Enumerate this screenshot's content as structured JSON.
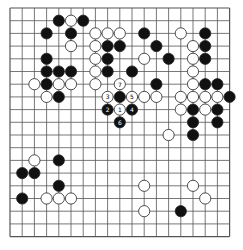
{
  "board": {
    "size": 19,
    "origin": {
      "x": 10,
      "y": 8
    },
    "spacing": {
      "x": 12.2,
      "y": 12.7
    },
    "stone_radius": 5.6,
    "colors": {
      "line": "#555555",
      "black": "#111111",
      "white": "#ffffff",
      "background": "#ffffff"
    }
  },
  "stones": [
    {
      "c": 4,
      "r": 1,
      "color": "B"
    },
    {
      "c": 5,
      "r": 1,
      "color": "W"
    },
    {
      "c": 6,
      "r": 1,
      "color": "B"
    },
    {
      "c": 3,
      "r": 2,
      "color": "B"
    },
    {
      "c": 5,
      "r": 2,
      "color": "B"
    },
    {
      "c": 7,
      "r": 2,
      "color": "W"
    },
    {
      "c": 8,
      "r": 2,
      "color": "W"
    },
    {
      "c": 9,
      "r": 2,
      "color": "W"
    },
    {
      "c": 11,
      "r": 2,
      "color": "B"
    },
    {
      "c": 14,
      "r": 2,
      "color": "W"
    },
    {
      "c": 16,
      "r": 2,
      "color": "B"
    },
    {
      "c": 5,
      "r": 3,
      "color": "W"
    },
    {
      "c": 7,
      "r": 3,
      "color": "W"
    },
    {
      "c": 8,
      "r": 3,
      "color": "B"
    },
    {
      "c": 9,
      "r": 3,
      "color": "B"
    },
    {
      "c": 12,
      "r": 3,
      "color": "B"
    },
    {
      "c": 15,
      "r": 3,
      "color": "W"
    },
    {
      "c": 16,
      "r": 3,
      "color": "B"
    },
    {
      "c": 3,
      "r": 4,
      "color": "B"
    },
    {
      "c": 7,
      "r": 4,
      "color": "W"
    },
    {
      "c": 8,
      "r": 4,
      "color": "B"
    },
    {
      "c": 11,
      "r": 4,
      "color": "W"
    },
    {
      "c": 13,
      "r": 4,
      "color": "B"
    },
    {
      "c": 15,
      "r": 4,
      "color": "W"
    },
    {
      "c": 16,
      "r": 4,
      "color": "B"
    },
    {
      "c": 3,
      "r": 5,
      "color": "B"
    },
    {
      "c": 4,
      "r": 5,
      "color": "B"
    },
    {
      "c": 5,
      "r": 5,
      "color": "B"
    },
    {
      "c": 7,
      "r": 5,
      "color": "W"
    },
    {
      "c": 8,
      "r": 5,
      "color": "B"
    },
    {
      "c": 10,
      "r": 5,
      "color": "B"
    },
    {
      "c": 15,
      "r": 5,
      "color": "W"
    },
    {
      "c": 2,
      "r": 6,
      "color": "W"
    },
    {
      "c": 3,
      "r": 6,
      "color": "B"
    },
    {
      "c": 4,
      "r": 6,
      "color": "W"
    },
    {
      "c": 5,
      "r": 6,
      "color": "W"
    },
    {
      "c": 7,
      "r": 6,
      "color": "W"
    },
    {
      "c": 9,
      "r": 6,
      "color": "W",
      "label": "7"
    },
    {
      "c": 12,
      "r": 6,
      "color": "B"
    },
    {
      "c": 15,
      "r": 6,
      "color": "W"
    },
    {
      "c": 16,
      "r": 6,
      "color": "B"
    },
    {
      "c": 17,
      "r": 6,
      "color": "B"
    },
    {
      "c": 3,
      "r": 7,
      "color": "W"
    },
    {
      "c": 4,
      "r": 7,
      "color": "B"
    },
    {
      "c": 8,
      "r": 7,
      "color": "W",
      "label": "3"
    },
    {
      "c": 9,
      "r": 7,
      "color": "B"
    },
    {
      "c": 10,
      "r": 7,
      "color": "W",
      "label": "5"
    },
    {
      "c": 11,
      "r": 7,
      "color": "W"
    },
    {
      "c": 12,
      "r": 7,
      "color": "W"
    },
    {
      "c": 14,
      "r": 7,
      "color": "W"
    },
    {
      "c": 15,
      "r": 7,
      "color": "W"
    },
    {
      "c": 16,
      "r": 7,
      "color": "W"
    },
    {
      "c": 17,
      "r": 7,
      "color": "W"
    },
    {
      "c": 18,
      "r": 7,
      "color": "B"
    },
    {
      "c": 8,
      "r": 8,
      "color": "B",
      "label": "2"
    },
    {
      "c": 9,
      "r": 8,
      "color": "W",
      "label": "1"
    },
    {
      "c": 10,
      "r": 8,
      "color": "B",
      "label": "4"
    },
    {
      "c": 14,
      "r": 8,
      "color": "W"
    },
    {
      "c": 15,
      "r": 8,
      "color": "B"
    },
    {
      "c": 16,
      "r": 8,
      "color": "W"
    },
    {
      "c": 17,
      "r": 8,
      "color": "B"
    },
    {
      "c": 9,
      "r": 9,
      "color": "B",
      "label": "6"
    },
    {
      "c": 15,
      "r": 9,
      "color": "B"
    },
    {
      "c": 17,
      "r": 9,
      "color": "B"
    },
    {
      "c": 13,
      "r": 10,
      "color": "W"
    },
    {
      "c": 15,
      "r": 10,
      "color": "B"
    },
    {
      "c": 2,
      "r": 12,
      "color": "W"
    },
    {
      "c": 4,
      "r": 12,
      "color": "B"
    },
    {
      "c": 1,
      "r": 13,
      "color": "B"
    },
    {
      "c": 2,
      "r": 13,
      "color": "B"
    },
    {
      "c": 4,
      "r": 14,
      "color": "B"
    },
    {
      "c": 11,
      "r": 14,
      "color": "W"
    },
    {
      "c": 15,
      "r": 14,
      "color": "W"
    },
    {
      "c": 1,
      "r": 15,
      "color": "B"
    },
    {
      "c": 3,
      "r": 15,
      "color": "W"
    },
    {
      "c": 4,
      "r": 15,
      "color": "W"
    },
    {
      "c": 5,
      "r": 15,
      "color": "W"
    },
    {
      "c": 16,
      "r": 15,
      "color": "W"
    },
    {
      "c": 11,
      "r": 16,
      "color": "W"
    },
    {
      "c": 14,
      "r": 16,
      "color": "B"
    }
  ]
}
